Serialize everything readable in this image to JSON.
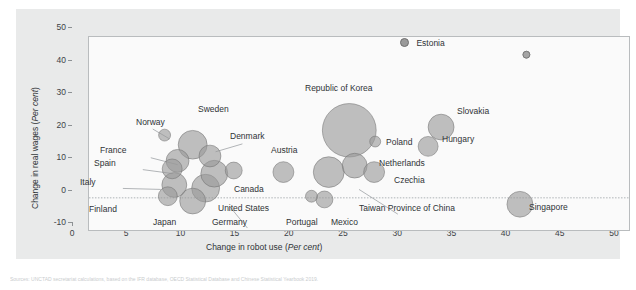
{
  "figure": {
    "background": "#ffffff",
    "panel_color": "#e9eaea",
    "plot_color": "#fafafa",
    "bubble_fill": "#9a9a9a",
    "bubble_stroke": "#6e6e6e",
    "axis_color": "#8d9194",
    "text_color": "#2f3336"
  },
  "chart_data": {
    "type": "scatter",
    "title": "",
    "xlabel": "Change in robot use (Per cent)",
    "ylabel": "Change in real wages (Per cent)",
    "xlim": [
      0,
      50
    ],
    "ylim": [
      -10,
      50
    ],
    "xticks": [
      0,
      5,
      10,
      15,
      20,
      25,
      30,
      35,
      40,
      45,
      50
    ],
    "yticks": [
      -10,
      0,
      10,
      20,
      30,
      40,
      50
    ],
    "grid": false,
    "zero_line": true,
    "legend": "none",
    "size_note": "bubble area encodes economy size",
    "points": [
      {
        "name": "Norway",
        "x": 7.0,
        "y": 19.5,
        "r": 6.0
      },
      {
        "name": "Sweden",
        "x": 9.6,
        "y": 16.5,
        "r": 14.5
      },
      {
        "name": "Denmark",
        "x": 11.2,
        "y": 13.0,
        "r": 11.0
      },
      {
        "name": "France",
        "x": 8.2,
        "y": 11.5,
        "r": 11.5
      },
      {
        "name": "Spain",
        "x": 7.7,
        "y": 9.0,
        "r": 10.0
      },
      {
        "name": "Italy",
        "x": 7.9,
        "y": 4.0,
        "r": 12.5
      },
      {
        "name": "Finland",
        "x": 7.3,
        "y": 0.5,
        "r": 9.5
      },
      {
        "name": "Japan",
        "x": 9.6,
        "y": -1.0,
        "r": 13.0
      },
      {
        "name": "Germany",
        "x": 10.8,
        "y": 3.0,
        "r": 14.0
      },
      {
        "name": "United States",
        "x": 11.6,
        "y": 7.5,
        "r": 13.5
      },
      {
        "name": "Canada",
        "x": 13.4,
        "y": 8.5,
        "r": 8.5
      },
      {
        "name": "Austria",
        "x": 18.0,
        "y": 8.0,
        "r": 10.5
      },
      {
        "name": "Republic of Korea",
        "x": 24.1,
        "y": 21.0,
        "r": 27.0
      },
      {
        "name": "Poland",
        "x": 26.5,
        "y": 17.5,
        "r": 5.5
      },
      {
        "name": "Slovakia",
        "x": 32.6,
        "y": 22.0,
        "r": 13.0
      },
      {
        "name": "Hungary",
        "x": 31.4,
        "y": 16.0,
        "r": 10.0
      },
      {
        "name": "Netherlands",
        "x": 24.6,
        "y": 10.0,
        "r": 12.5
      },
      {
        "name": "Czechia",
        "x": 26.4,
        "y": 8.0,
        "r": 10.5
      },
      {
        "name": "Taiwan Province of China",
        "x": 22.2,
        "y": 8.0,
        "r": 15.5
      },
      {
        "name": "Mexico",
        "x": 21.8,
        "y": -0.5,
        "r": 8.5
      },
      {
        "name": "Portugal",
        "x": 20.6,
        "y": 0.5,
        "r": 6.0
      },
      {
        "name": "Singapore",
        "x": 39.9,
        "y": -2.0,
        "r": 13.0
      },
      {
        "name": "Estonia",
        "x": 40.5,
        "y": 44.5,
        "r": 3.5
      }
    ]
  },
  "axes": {
    "x_title_plain": "Change in robot use (",
    "x_title_italic": "Per cent",
    "x_title_close": ")",
    "y_title_plain": "Change in real wages (",
    "y_title_italic": "Per cent",
    "y_title_close": ")",
    "xtick_labels": [
      "0",
      "5",
      "10",
      "15",
      "20",
      "25",
      "30",
      "35",
      "40",
      "45",
      "50"
    ],
    "ytick_labels": [
      "-10",
      "0",
      "10",
      "20",
      "30",
      "40",
      "50"
    ]
  },
  "legend": {
    "estonia_label": "Estonia"
  },
  "labels": [
    {
      "text": "Norway",
      "x": 120,
      "y": 114,
      "align": "left"
    },
    {
      "text": "Sweden",
      "x": 182,
      "y": 101,
      "align": "left"
    },
    {
      "text": "Denmark",
      "x": 214,
      "y": 128,
      "align": "left"
    },
    {
      "text": "France",
      "x": 84,
      "y": 142,
      "align": "left"
    },
    {
      "text": "Spain",
      "x": 78,
      "y": 155,
      "align": "left"
    },
    {
      "text": "Italy",
      "x": 64,
      "y": 174,
      "align": "left"
    },
    {
      "text": "Finland",
      "x": 73,
      "y": 201,
      "align": "left"
    },
    {
      "text": "Japan",
      "x": 137,
      "y": 214,
      "align": "left"
    },
    {
      "text": "Germany",
      "x": 196,
      "y": 214,
      "align": "left"
    },
    {
      "text": "United States",
      "x": 202,
      "y": 200,
      "align": "left"
    },
    {
      "text": "Canada",
      "x": 218,
      "y": 181,
      "align": "left"
    },
    {
      "text": "Austria",
      "x": 255,
      "y": 142,
      "align": "left"
    },
    {
      "text": "Republic of Korea",
      "x": 289,
      "y": 80,
      "align": "left"
    },
    {
      "text": "Poland",
      "x": 370,
      "y": 134,
      "align": "left"
    },
    {
      "text": "Slovakia",
      "x": 441,
      "y": 103,
      "align": "left"
    },
    {
      "text": "Hungary",
      "x": 426,
      "y": 131,
      "align": "left"
    },
    {
      "text": "Netherlands",
      "x": 363,
      "y": 155,
      "align": "left"
    },
    {
      "text": "Czechia",
      "x": 378,
      "y": 172,
      "align": "left"
    },
    {
      "text": "Taiwan Province of China",
      "x": 343,
      "y": 200,
      "align": "left"
    },
    {
      "text": "Mexico",
      "x": 315,
      "y": 214,
      "align": "left"
    },
    {
      "text": "Portugal",
      "x": 270,
      "y": 214,
      "align": "left"
    },
    {
      "text": "Singapore",
      "x": 513,
      "y": 199,
      "align": "left"
    }
  ],
  "leaders": [
    {
      "x1": 120,
      "y1": 111,
      "x2": 137,
      "y2": 121
    },
    {
      "x1": 118,
      "y1": 140,
      "x2": 145,
      "y2": 147
    },
    {
      "x1": 110,
      "y1": 152,
      "x2": 140,
      "y2": 156
    },
    {
      "x1": 90,
      "y1": 171,
      "x2": 128,
      "y2": 172
    },
    {
      "x1": 210,
      "y1": 126,
      "x2": 183,
      "y2": 134
    },
    {
      "x1": 215,
      "y1": 211,
      "x2": 197,
      "y2": 189
    },
    {
      "x1": 366,
      "y1": 197,
      "x2": 327,
      "y2": 172
    }
  ],
  "caption": "Sources: UNCTAD secretariat calculations, based on the IFR database, OECD Statistical Database and Chinese Statistical Yearbook 2019."
}
